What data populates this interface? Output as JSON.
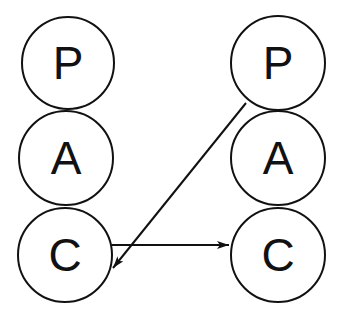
{
  "diagram": {
    "left_stack": {
      "nodes": [
        {
          "label": "P",
          "cx": 68,
          "cy": 63,
          "r": 46
        },
        {
          "label": "A",
          "cx": 66,
          "cy": 158,
          "r": 47
        },
        {
          "label": "C",
          "cx": 65,
          "cy": 255,
          "r": 47
        }
      ]
    },
    "right_stack": {
      "nodes": [
        {
          "label": "P",
          "cx": 278,
          "cy": 63,
          "r": 47
        },
        {
          "label": "A",
          "cx": 278,
          "cy": 158,
          "r": 47
        },
        {
          "label": "C",
          "cx": 278,
          "cy": 255,
          "r": 47
        }
      ]
    },
    "edges": [
      {
        "from": "left.C",
        "to": "right.C",
        "x1": 112,
        "y1": 245,
        "x2": 229,
        "y2": 245
      },
      {
        "from": "right.P",
        "to": "left.C",
        "x1": 246,
        "y1": 103,
        "x2": 113,
        "y2": 268
      }
    ],
    "colors": {
      "stroke": "#111111",
      "fill": "#ffffff"
    }
  }
}
